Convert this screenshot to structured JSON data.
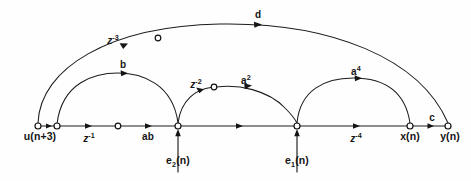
{
  "figure": {
    "type": "signal-flow-graph",
    "title": "",
    "background_color": "#fefefe",
    "line_color": "#1c1c1c",
    "width": 471,
    "height": 181
  },
  "nodes": [
    {
      "id": "u",
      "label": "u(n+3)",
      "x": 38,
      "y": 126,
      "label_x": 38,
      "label_y": 133,
      "radius": 3.0,
      "kind": "source"
    },
    {
      "id": "n2",
      "label": "",
      "x": 57,
      "y": 126,
      "label_x": 57,
      "label_y": 133,
      "radius": 3.0,
      "kind": "junction"
    },
    {
      "id": "n3",
      "label": "",
      "x": 118,
      "y": 126,
      "label_x": 118,
      "label_y": 133,
      "radius": 2.8,
      "kind": "junction"
    },
    {
      "id": "e2node",
      "label": "",
      "x": 178,
      "y": 126,
      "label_x": 178,
      "label_y": 133,
      "radius": 3.0,
      "kind": "summing"
    },
    {
      "id": "n5",
      "label": "",
      "x": 214,
      "y": 87,
      "label_x": 214,
      "label_y": 94,
      "radius": 2.8,
      "kind": "junction"
    },
    {
      "id": "e1node",
      "label": "",
      "x": 297,
      "y": 126,
      "label_x": 297,
      "label_y": 133,
      "radius": 3.0,
      "kind": "summing"
    },
    {
      "id": "xn",
      "label": "x(n)",
      "x": 410,
      "y": 126,
      "label_x": 410,
      "label_y": 133,
      "radius": 3.0,
      "kind": "state"
    },
    {
      "id": "yn",
      "label": "y(n)",
      "x": 448,
      "y": 126,
      "label_x": 448,
      "label_y": 133,
      "radius": 3.0,
      "kind": "output"
    },
    {
      "id": "ntop",
      "label": "",
      "x": 158,
      "y": 38,
      "label_x": 158,
      "label_y": 45,
      "radius": 2.8,
      "kind": "junction"
    }
  ],
  "branches": [
    {
      "id": "b-u-n2",
      "from": "u",
      "to": "n2",
      "label": "",
      "label_html": "",
      "path_kind": "line"
    },
    {
      "id": "b-n2-n3",
      "from": "n2",
      "to": "n3",
      "label": "z-1",
      "label_html": "z<sup>-1</sup>",
      "path_kind": "line"
    },
    {
      "id": "b-n3-e2",
      "from": "n3",
      "to": "e2node",
      "label": "ab",
      "label_html": "ab",
      "path_kind": "line"
    },
    {
      "id": "b-e2-e1",
      "from": "e2node",
      "to": "e1node",
      "label": "",
      "label_html": "",
      "path_kind": "line"
    },
    {
      "id": "b-e1-xn",
      "from": "e1node",
      "to": "xn",
      "label": "z-4",
      "label_html": "z<sup>-4</sup>",
      "path_kind": "line"
    },
    {
      "id": "b-xn-yn",
      "from": "xn",
      "to": "yn",
      "label": "c",
      "label_html": "c",
      "path_kind": "line"
    },
    {
      "id": "b-arc-b",
      "from": "n2",
      "to": "e2node",
      "label": "b",
      "label_html": "b",
      "path_kind": "arc"
    },
    {
      "id": "b-arc-a2",
      "from": "e2node",
      "to": "e1node",
      "label": "a2",
      "label_html": "a<sup>2</sup>",
      "path_kind": "arc"
    },
    {
      "id": "b-arc-z2",
      "from": "e2node",
      "to": "n5",
      "label": "z-2",
      "label_html": "z<sup>-2</sup>",
      "path_kind": "arc"
    },
    {
      "id": "b-arc-a4",
      "from": "e1node",
      "to": "xn",
      "label": "a4",
      "label_html": "a<sup>4</sup>",
      "path_kind": "arc"
    },
    {
      "id": "b-arc-top",
      "from": "u",
      "to": "yn",
      "label": "d",
      "label_html": "d",
      "path_kind": "arc"
    },
    {
      "id": "b-arc-top-z3",
      "from": "u",
      "to": "ntop",
      "label": "z-3",
      "label_html": "z<sup>-3</sup>",
      "path_kind": "arc"
    }
  ],
  "inputs": [
    {
      "id": "e2",
      "label": "e2(n)",
      "target_node": "e2node",
      "x": 178,
      "label_x": 178,
      "label_y": 158,
      "arrow_from_y": 172,
      "arrow_to_y": 131
    },
    {
      "id": "e1",
      "label": "e1(n)",
      "target_node": "e1node",
      "x": 297,
      "label_x": 297,
      "label_y": 158,
      "arrow_from_y": 172,
      "arrow_to_y": 131
    }
  ],
  "labels": {
    "node_u": "u(n+3)",
    "node_x": "x(n)",
    "node_y": "y(n)",
    "branch_z1_base": "z",
    "branch_z1_exp": "-1",
    "branch_ab": "ab",
    "branch_z4_base": "z",
    "branch_z4_exp": "-4",
    "branch_c": "c",
    "branch_b": "b",
    "branch_a2_base": "a",
    "branch_a2_exp": "2",
    "branch_a4_base": "a",
    "branch_a4_exp": "4",
    "branch_z2_base": "z",
    "branch_z2_exp": "-2",
    "branch_z3_base": "z",
    "branch_z3_exp": "-3",
    "branch_d": "d",
    "input_e2_base": "e",
    "input_e2_sub": "2",
    "input_e2_tail": "(n)",
    "input_e1_base": "e",
    "input_e1_sub": "1",
    "input_e1_tail": "(n)"
  }
}
